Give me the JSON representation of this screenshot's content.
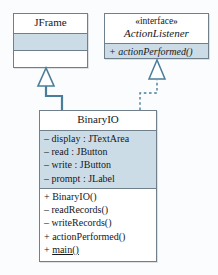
{
  "diagram": {
    "type": "uml-class-diagram",
    "background_color": "#fbfcfd",
    "border_color": "#6f7f8c",
    "shaded_compartment_color": "#ccdce7",
    "connector_color": "#4a7d99"
  },
  "classes": {
    "jframe": {
      "name": "JFrame",
      "attributes": [],
      "methods": []
    },
    "action_listener": {
      "stereotype": "«interface»",
      "name": "ActionListener",
      "methods": [
        {
          "visibility": "+",
          "text": "actionPerformed()"
        }
      ]
    },
    "binary_io": {
      "name": "BinaryIO",
      "attributes": [
        {
          "visibility": "–",
          "text": "display : JTextArea"
        },
        {
          "visibility": "–",
          "text": "read : JButton"
        },
        {
          "visibility": "–",
          "text": "write : JButton"
        },
        {
          "visibility": "–",
          "text": "prompt : JLabel"
        }
      ],
      "methods": [
        {
          "visibility": "+",
          "text": "BinaryIO()",
          "static": false
        },
        {
          "visibility": "–",
          "text": "readRecords()",
          "static": false
        },
        {
          "visibility": "–",
          "text": "writeRecords()",
          "static": false
        },
        {
          "visibility": "+",
          "text": "actionPerformed()",
          "static": false
        },
        {
          "visibility": "+",
          "text": "main()",
          "static": true
        }
      ]
    }
  },
  "relationships": [
    {
      "kind": "generalization",
      "from": "BinaryIO",
      "to": "JFrame",
      "line_style": "solid",
      "arrowhead": "hollow-triangle"
    },
    {
      "kind": "realization",
      "from": "BinaryIO",
      "to": "ActionListener",
      "line_style": "dashed",
      "arrowhead": "hollow-triangle"
    }
  ]
}
